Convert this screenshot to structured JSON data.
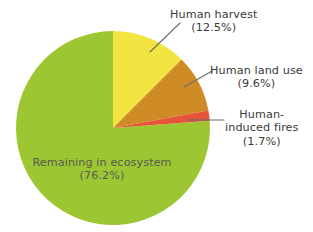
{
  "chart_data": {
    "type": "pie",
    "title": "",
    "subtitle": "",
    "xlabel": "",
    "ylabel": "",
    "legend_position": "none",
    "grid": false,
    "units": "percent",
    "total": 100.0,
    "categories": [
      "Human harvest",
      "Human land use",
      "Human-induced fires",
      "Remaining in ecosystem"
    ],
    "values": [
      12.5,
      9.6,
      1.7,
      76.2
    ],
    "colors": [
      "#F2E542",
      "#CE8B26",
      "#E6543A",
      "#9DC633"
    ],
    "start_angle_deg": 90,
    "direction": "clockwise",
    "slices": [
      {
        "label": "Human harvest",
        "value": 12.5,
        "value_text": "(12.5%)",
        "color": "#F2E542",
        "label_placement": "outside",
        "leader_line": true
      },
      {
        "label": "Human land use",
        "value": 9.6,
        "value_text": "(9.6%)",
        "color": "#CE8B26",
        "label_placement": "outside",
        "leader_line": true
      },
      {
        "label": "Human-induced fires",
        "label_line1": "Human-",
        "label_line2": "induced fires",
        "value": 1.7,
        "value_text": "(1.7%)",
        "color": "#E6543A",
        "label_placement": "outside",
        "leader_line": true
      },
      {
        "label": "Remaining in ecosystem",
        "value": 76.2,
        "value_text": "(76.2%)",
        "color": "#9DC633",
        "label_placement": "inside",
        "leader_line": false
      }
    ]
  },
  "labels": {
    "harvest": {
      "name": "Human harvest",
      "pct": "(12.5%)"
    },
    "landuse": {
      "name": "Human land use",
      "pct": "(9.6%)"
    },
    "fires": {
      "name_line1": "Human-",
      "name_line2": "induced fires",
      "pct": "(1.7%)"
    },
    "remaining": {
      "name": "Remaining in ecosystem",
      "pct": "(76.2%)"
    }
  },
  "palette": {
    "green": "#9DC633",
    "yellow": "#F2E542",
    "orange": "#CE8B26",
    "red": "#E6543A",
    "background": "#FFFFFF",
    "label_text": "#3A3A3A",
    "inside_label_text": "#5A5A52",
    "leader_line": "#6C6C6C"
  },
  "geometry": {
    "center_x": 113,
    "center_y": 128,
    "radius": 97
  }
}
